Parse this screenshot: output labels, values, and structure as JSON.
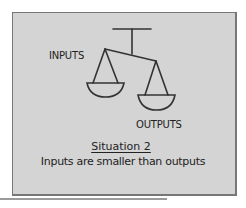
{
  "figure": {
    "labels": {
      "left_pan": "INPUTS",
      "right_pan": "OUTPUTS"
    },
    "caption": {
      "title": "Situation 2",
      "subtitle": "Inputs are smaller than outputs"
    },
    "colors": {
      "panel_background": "#d4d4d4",
      "stroke": "#333333",
      "border": "#777777"
    }
  }
}
